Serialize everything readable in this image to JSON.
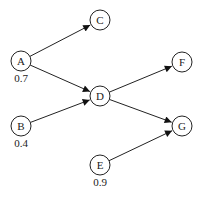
{
  "diagram": {
    "type": "directed-graph",
    "nodes": [
      {
        "id": "A",
        "label": "A",
        "x": 21,
        "y": 61,
        "prob": "0.7"
      },
      {
        "id": "B",
        "label": "B",
        "x": 21,
        "y": 126,
        "prob": "0.4"
      },
      {
        "id": "C",
        "label": "C",
        "x": 100,
        "y": 20
      },
      {
        "id": "D",
        "label": "D",
        "x": 100,
        "y": 96
      },
      {
        "id": "E",
        "label": "E",
        "x": 100,
        "y": 165,
        "prob": "0.9"
      },
      {
        "id": "F",
        "label": "F",
        "x": 182,
        "y": 62
      },
      {
        "id": "G",
        "label": "G",
        "x": 182,
        "y": 126
      }
    ],
    "edges": [
      {
        "from": "A",
        "to": "C"
      },
      {
        "from": "A",
        "to": "D"
      },
      {
        "from": "B",
        "to": "D"
      },
      {
        "from": "D",
        "to": "F"
      },
      {
        "from": "D",
        "to": "G"
      },
      {
        "from": "E",
        "to": "G"
      }
    ],
    "colors": {
      "stroke": "#222222",
      "background": "#ffffff",
      "prob_text": "#555555"
    }
  }
}
